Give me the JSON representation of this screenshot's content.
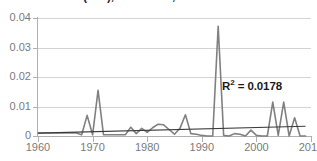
{
  "chart_data": {
    "type": "line",
    "title": "(ARI), Accidents, 1960-2009",
    "xlabel": "",
    "ylabel": "",
    "xlim": [
      1960,
      2010
    ],
    "ylim": [
      0,
      0.04
    ],
    "grid": true,
    "legend": false,
    "x_ticks": [
      "1960",
      "1970",
      "1980",
      "1990",
      "2000",
      "2010"
    ],
    "x_tick_values": [
      1960,
      1970,
      1980,
      1990,
      2000,
      2010
    ],
    "y_ticks": [
      "0",
      "0.01",
      "0.02",
      "0.03",
      "0.04"
    ],
    "y_tick_values": [
      0,
      0.01,
      0.02,
      0.03,
      0.04
    ],
    "series": [
      {
        "name": "annual-rate",
        "color": "#808080",
        "x": [
          1960,
          1961,
          1962,
          1963,
          1964,
          1965,
          1966,
          1967,
          1968,
          1969,
          1970,
          1971,
          1972,
          1973,
          1974,
          1975,
          1976,
          1977,
          1978,
          1979,
          1980,
          1981,
          1982,
          1983,
          1984,
          1985,
          1986,
          1987,
          1988,
          1989,
          1990,
          1991,
          1992,
          1993,
          1994,
          1995,
          1996,
          1997,
          1998,
          1999,
          2000,
          2001,
          2002,
          2003,
          2004,
          2005,
          2006,
          2007,
          2008,
          2009
        ],
        "values": [
          0.001,
          0.001,
          0.001,
          0.001,
          0.001,
          0.001,
          0.001,
          0.001,
          0.0004,
          0.007,
          0.0004,
          0.0155,
          0.0004,
          0.0004,
          0.0004,
          0.0004,
          0.0004,
          0.003,
          0.0008,
          0.0026,
          0.0012,
          0.0028,
          0.004,
          0.0038,
          0.0022,
          0.0006,
          0.0026,
          0.0072,
          0.0008,
          0.0006,
          0.0002,
          0.0,
          0.0,
          0.0372,
          0.0002,
          0.0,
          0.0008,
          0.0006,
          0.0,
          0.002,
          0.0002,
          0.0,
          0.0,
          0.0115,
          0.0002,
          0.0115,
          0.0,
          0.0062,
          0.0,
          0.0
        ]
      }
    ],
    "trendline": {
      "name": "linear-trend",
      "color": "#3a3a3a",
      "x": [
        1960,
        2009
      ],
      "values": [
        0.001,
        0.0033
      ],
      "r_squared": 0.0178,
      "r_squared_label": "= 0.0178",
      "r_symbol": "R",
      "r_exponent": "2"
    }
  },
  "axes": {
    "y_labels": [
      "0.04",
      "0.03",
      "0.02",
      "0.01",
      "0"
    ],
    "x_labels": [
      "1960",
      "1970",
      "1980",
      "1990",
      "2000",
      "2010"
    ]
  },
  "colors": {
    "series": "#808080",
    "trendline": "#3a3a3a",
    "gridline": "#d3d3d3",
    "axis": "#b0b0b0",
    "tick_text": "#7a7a7a",
    "annotation_text": "#1a1a1a",
    "background": "#ffffff"
  }
}
